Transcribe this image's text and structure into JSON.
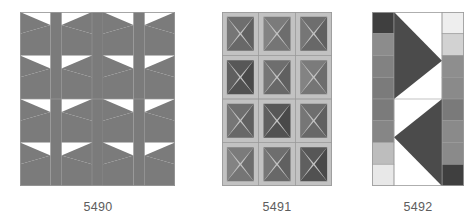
{
  "page": {
    "background": "#ffffff",
    "caption_color": "#5d5d5d"
  },
  "palette": {
    "white": "#ffffff",
    "mid_gray": "#7b7b7b",
    "dark_gray": "#6e6e6e",
    "darker_gray": "#575757",
    "deep_gray": "#4b4b4b",
    "light_band": "#c2c2c2",
    "pale": "#d9d9d9",
    "paler": "#ececec",
    "outline": "#9a9a9a"
  },
  "blocks": [
    {
      "id": "5490",
      "label": "5490",
      "name": "triangle-sashing-block",
      "x": 20,
      "y": 12,
      "w": 155,
      "h": 174,
      "grid": {
        "columns": 4,
        "rows": 4,
        "sash_strips": 3
      },
      "description": "Four columns of opposing triangles separated by solid vertical sashing strips",
      "colors": {
        "figure": "#7b7b7b",
        "ground": "#ffffff",
        "sash": "#7b7b7b",
        "outline": "#9a9a9a"
      }
    },
    {
      "id": "5491",
      "label": "5491",
      "name": "diagonal-cross-grid-block",
      "x": 222,
      "y": 12,
      "w": 110,
      "h": 174,
      "grid": {
        "columns": 3,
        "rows": 4
      },
      "description": "Grid of squares each quartered by pale diagonal bands forming an X",
      "cell_tones": [
        [
          "#6e6e6e",
          "#575757",
          "#6e6e6e",
          "#7b7b7b"
        ],
        [
          "#7b7b7b",
          "#6e6e6e",
          "#575757",
          "#6e6e6e"
        ],
        [
          "#6e6e6e",
          "#7b7b7b",
          "#6e6e6e",
          "#575757"
        ]
      ],
      "colors": {
        "band": "#c2c2c2",
        "outline": "#9a9a9a"
      }
    },
    {
      "id": "5492",
      "label": "5492",
      "name": "gradient-column-arrow-block",
      "x": 372,
      "y": 12,
      "w": 92,
      "h": 174,
      "grid": {
        "columns": 3,
        "rows": 8
      },
      "description": "Two gradient columns of squares flanking large dark triangles on white",
      "left_column_tones": [
        "#3f3f3f",
        "#8c8c8c",
        "#828282",
        "#7b7b7b",
        "#7b7b7b",
        "#868686",
        "#bdbdbd",
        "#e8e8e8"
      ],
      "right_column_tones": [
        "#eeeeee",
        "#d2d2d2",
        "#8e8e8e",
        "#8a8a8a",
        "#7a7a7a",
        "#8a8a8a",
        "#8a8a8a",
        "#3f3f3f"
      ],
      "center": {
        "ground": "#ffffff",
        "triangle_color": "#4b4b4b",
        "triangles": [
          {
            "name": "upper-right-pointing-triangle",
            "direction": "right"
          },
          {
            "name": "lower-left-pointing-triangle",
            "direction": "left"
          }
        ]
      },
      "colors": {
        "outline": "#9a9a9a"
      }
    }
  ],
  "captions": [
    {
      "text": "5490",
      "x": 60,
      "y": 200,
      "w": 76
    },
    {
      "text": "5491",
      "x": 239,
      "y": 200,
      "w": 76
    },
    {
      "text": "5492",
      "x": 380,
      "y": 200,
      "w": 76
    }
  ]
}
